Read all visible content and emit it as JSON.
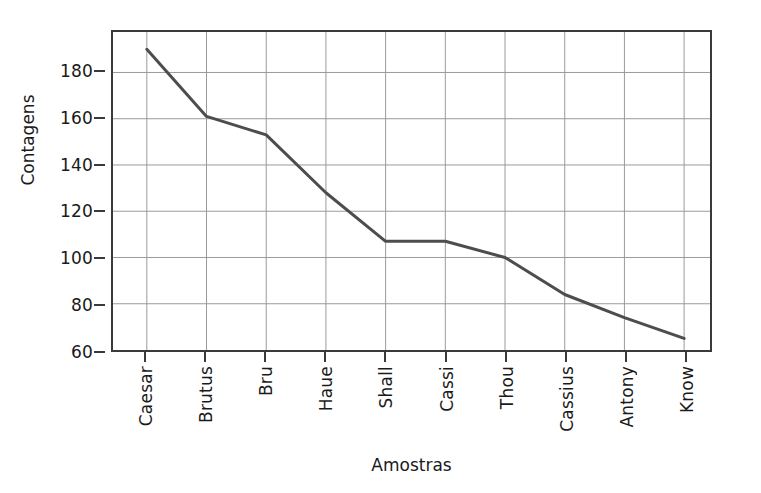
{
  "chart_data": {
    "type": "line",
    "title": "",
    "xlabel": "Amostras",
    "ylabel": "Contagens",
    "categories": [
      "Caesar",
      "Brutus",
      "Bru",
      "Haue",
      "Shall",
      "Cassi",
      "Thou",
      "Cassius",
      "Antony",
      "Know"
    ],
    "values": [
      190,
      161,
      153,
      128,
      107,
      107,
      100,
      84,
      74,
      65
    ],
    "series": [
      {
        "name": "Contagens",
        "values": [
          190,
          161,
          153,
          128,
          107,
          107,
          100,
          84,
          74,
          65
        ]
      }
    ],
    "ylim": [
      60,
      197.5
    ],
    "yticks": [
      60,
      80,
      100,
      120,
      140,
      160,
      180
    ],
    "ytick_labels": [
      "60",
      "80",
      "100",
      "120",
      "140",
      "160",
      "180"
    ],
    "grid": true,
    "legend": "none",
    "line_color": "#4d4d4d",
    "grid_color": "#9a9a9a",
    "axis_color": "#3a3a3a",
    "background_color": "#ffffff"
  }
}
